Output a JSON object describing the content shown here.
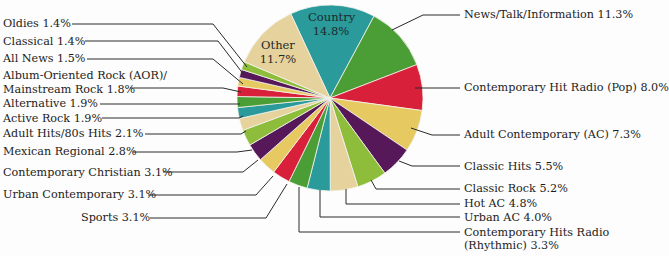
{
  "chart_data": {
    "type": "pie",
    "title": "",
    "start_angle_deg": -25,
    "direction": "clockwise",
    "center": [
      330,
      98
    ],
    "radius": 93,
    "colors": {
      "teal": "#2a9a9b",
      "green": "#4a9e35",
      "red": "#d8203a",
      "yellow": "#e7c962",
      "purple": "#57185a",
      "lime": "#8dbd3a",
      "beige": "#e6d29c"
    },
    "slices": [
      {
        "label": "Country",
        "value": 14.8,
        "color": "#2a9a9b",
        "display": "Country\n14.8%",
        "inside": true
      },
      {
        "label": "News/Talk/Information",
        "value": 11.3,
        "color": "#4a9e35",
        "display": "News/Talk/Information 11.3%"
      },
      {
        "label": "Contemporary Hit Radio (Pop)",
        "value": 8.0,
        "color": "#d8203a",
        "display": "Contemporary Hit Radio (Pop) 8.0%"
      },
      {
        "label": "Adult Contemporary (AC)",
        "value": 7.3,
        "color": "#e7c962",
        "display": "Adult Contemporary (AC) 7.3%"
      },
      {
        "label": "Classic Hits",
        "value": 5.5,
        "color": "#57185a",
        "display": "Classic Hits 5.5%"
      },
      {
        "label": "Classic Rock",
        "value": 5.2,
        "color": "#8dbd3a",
        "display": "Classic Rock 5.2%"
      },
      {
        "label": "Hot AC",
        "value": 4.8,
        "color": "#e6d29c",
        "display": "Hot AC 4.8%"
      },
      {
        "label": "Urban AC",
        "value": 4.0,
        "color": "#2a9a9b",
        "display": "Urban AC 4.0%"
      },
      {
        "label": "Contemporary Hits Radio (Rhythmic)",
        "value": 3.3,
        "color": "#4a9e35",
        "display": "Contemporary Hits Radio\n(Rhythmic) 3.3%"
      },
      {
        "label": "Sports",
        "value": 3.1,
        "color": "#d8203a",
        "display": "Sports 3.1%"
      },
      {
        "label": "Urban Contemporary",
        "value": 3.1,
        "color": "#e7c962",
        "display": "Urban Contemporary 3.1%"
      },
      {
        "label": "Contemporary Christian",
        "value": 3.1,
        "color": "#57185a",
        "display": "Contemporary Christian 3.1%"
      },
      {
        "label": "Mexican Regional",
        "value": 2.8,
        "color": "#8dbd3a",
        "display": "Mexican Regional 2.8%"
      },
      {
        "label": "Adult Hits/80s Hits",
        "value": 2.1,
        "color": "#e6d29c",
        "display": "Adult Hits/80s Hits 2.1%"
      },
      {
        "label": "Active Rock",
        "value": 1.9,
        "color": "#2a9a9b",
        "display": "Active Rock 1.9%"
      },
      {
        "label": "Alternative",
        "value": 1.9,
        "color": "#4a9e35",
        "display": "Alternative 1.9%"
      },
      {
        "label": "Album-Oriented Rock (AOR)/Mainstream Rock",
        "value": 1.8,
        "color": "#d8203a",
        "display": "Album-Oriented Rock (AOR)/\nMainstream Rock 1.8%"
      },
      {
        "label": "All News",
        "value": 1.5,
        "color": "#e7c962",
        "display": "All News 1.5%"
      },
      {
        "label": "Classical",
        "value": 1.4,
        "color": "#57185a",
        "display": "Classical 1.4%"
      },
      {
        "label": "Oldies",
        "value": 1.4,
        "color": "#8dbd3a",
        "display": "Oldies 1.4%"
      },
      {
        "label": "Other",
        "value": 11.7,
        "color": "#e6d29c",
        "display": "Other\n11.7%",
        "inside": true
      }
    ]
  },
  "labels": {
    "country": [
      "Country",
      "14.8%"
    ],
    "other": [
      "Other",
      "11.7%"
    ],
    "news_talk": "News/Talk/Information 11.3%",
    "chr_pop": "Contemporary Hit Radio (Pop) 8.0%",
    "ac": "Adult Contemporary (AC) 7.3%",
    "classic_hits": "Classic Hits 5.5%",
    "classic_rock": "Classic Rock 5.2%",
    "hot_ac": "Hot AC 4.8%",
    "urban_ac": "Urban AC 4.0%",
    "chr_rhythmic": [
      "Contemporary Hits Radio",
      "(Rhythmic) 3.3%"
    ],
    "sports": "Sports 3.1%",
    "urban_contemporary": "Urban Contemporary 3.1%",
    "contemporary_christian": "Contemporary Christian 3.1%",
    "mexican_regional": "Mexican Regional 2.8%",
    "adult_hits": "Adult Hits/80s Hits 2.1%",
    "active_rock": "Active Rock 1.9%",
    "alternative": "Alternative 1.9%",
    "aor": [
      "Album-Oriented Rock (AOR)/",
      "Mainstream Rock 1.8%"
    ],
    "all_news": "All News 1.5%",
    "classical": "Classical 1.4%",
    "oldies": "Oldies 1.4%"
  }
}
